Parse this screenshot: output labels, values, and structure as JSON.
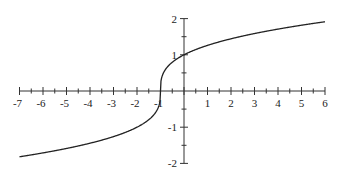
{
  "chart_data": {
    "type": "line",
    "title": "",
    "xlabel": "",
    "ylabel": "",
    "function": "y = cbrt(x + 1)",
    "xlim": [
      -7,
      6
    ],
    "ylim": [
      -2,
      2
    ],
    "grid": false,
    "x_ticks": [
      -7,
      -6,
      -5,
      -4,
      -3,
      -2,
      -1,
      1,
      2,
      3,
      4,
      5,
      6
    ],
    "x_minor_step": 0.5,
    "y_ticks": [
      -2,
      -1,
      1,
      2
    ],
    "y_minor_step": 0.5,
    "series": [
      {
        "name": "curve",
        "x": [
          -7,
          -6,
          -5,
          -4,
          -3,
          -2,
          -1.5,
          -1.1,
          -1,
          -0.9,
          -0.5,
          0,
          1,
          2,
          3,
          4,
          5,
          6
        ],
        "values": [
          -1.817,
          -1.71,
          -1.587,
          -1.442,
          -1.26,
          -1.0,
          -0.794,
          -0.464,
          0,
          0.464,
          0.794,
          1.0,
          1.26,
          1.442,
          1.587,
          1.71,
          1.817,
          1.913
        ]
      }
    ]
  }
}
